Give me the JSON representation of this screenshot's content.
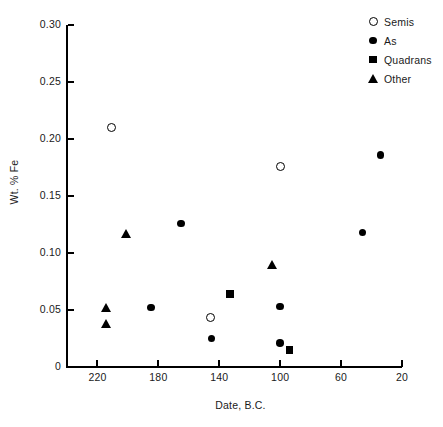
{
  "chart_data": {
    "type": "scatter",
    "title": "",
    "xlabel": "Date,  B.C.",
    "ylabel": "Wt. % Fe",
    "xlim": [
      240,
      20
    ],
    "ylim": [
      0,
      0.3
    ],
    "x_ticks": [
      "220",
      "180",
      "140",
      "100",
      "60",
      "20"
    ],
    "x_tick_values": [
      220,
      180,
      140,
      100,
      60,
      20
    ],
    "y_ticks": [
      "0",
      "0.05",
      "0.10",
      "0.15",
      "0.20",
      "0.25",
      "0.30"
    ],
    "y_tick_values": [
      0,
      0.05,
      0.1,
      0.15,
      0.2,
      0.25,
      0.3
    ],
    "x_axis_inverted": true,
    "grid": false,
    "legend_position": "top-right",
    "series": [
      {
        "name": "Semis",
        "marker": "circle-open",
        "points": [
          {
            "x": 211,
            "y": 0.21
          },
          {
            "x": 146,
            "y": 0.043
          },
          {
            "x": 100,
            "y": 0.176
          }
        ]
      },
      {
        "name": "As",
        "marker": "circle-filled",
        "points": [
          {
            "x": 185,
            "y": 0.052
          },
          {
            "x": 165,
            "y": 0.126
          },
          {
            "x": 145,
            "y": 0.025
          },
          {
            "x": 100,
            "y": 0.053
          },
          {
            "x": 100,
            "y": 0.021
          },
          {
            "x": 46,
            "y": 0.118
          },
          {
            "x": 34,
            "y": 0.186
          }
        ]
      },
      {
        "name": "Quadrans",
        "marker": "square-filled",
        "points": [
          {
            "x": 133,
            "y": 0.064
          },
          {
            "x": 94,
            "y": 0.015
          }
        ]
      },
      {
        "name": "Other",
        "marker": "triangle-filled",
        "points": [
          {
            "x": 214,
            "y": 0.052
          },
          {
            "x": 214,
            "y": 0.038
          },
          {
            "x": 201,
            "y": 0.117
          },
          {
            "x": 105,
            "y": 0.09
          }
        ]
      }
    ]
  },
  "legend": {
    "items": [
      {
        "label": "Semis",
        "marker": "circle-open"
      },
      {
        "label": "As",
        "marker": "circle-filled"
      },
      {
        "label": "Quadrans",
        "marker": "square-filled"
      },
      {
        "label": "Other",
        "marker": "triangle-filled"
      }
    ]
  },
  "colors": {
    "axis": "#000000",
    "marker": "#000000",
    "text": "#1a1a1a",
    "background": "#ffffff"
  }
}
